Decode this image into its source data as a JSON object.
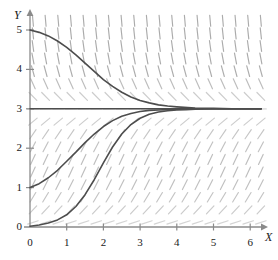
{
  "figure": {
    "kind": "direction-field-plot",
    "background": "#ffffff",
    "ink_color": "#1a1a1a",
    "field_color": "#8c8c8c",
    "curve_color": "#4d4d4d",
    "axis_color": "#8a8a8a"
  },
  "axes": {
    "x_name": "X",
    "y_name": "Y",
    "x_ticks": [
      "0",
      "1",
      "2",
      "3",
      "4",
      "5",
      "6"
    ],
    "y_ticks": [
      "0",
      "1",
      "2",
      "3",
      "4",
      "5"
    ],
    "x_origin_label": "0",
    "y_origin_label": "0"
  },
  "chart_data": {
    "type": "line",
    "title": "",
    "xlabel": "X",
    "ylabel": "Y",
    "xlim": [
      0,
      6.3
    ],
    "ylim": [
      0,
      5.3
    ],
    "grid": false,
    "legend": "none",
    "x_ticks": [
      0,
      1,
      2,
      3,
      4,
      5,
      6
    ],
    "y_ticks": [
      0,
      1,
      2,
      3,
      4,
      5
    ],
    "annotations": [
      "direction field of dy/dx = k*y*(3 - y)",
      "equilibrium solution y = 3",
      "equilibrium solution y = 0"
    ],
    "direction_field": {
      "description": "short line segments with slope proportional to y*(3-y); flat near y=0 and y=3, positive for 0<y<3, negative for y>3",
      "slope_rule": "dy/dx = 0.9 * y * (3 - y)",
      "x_start": 0.08,
      "x_step": 0.345,
      "y_start": 0.115,
      "y_step": 0.32,
      "segment_length_px": 11
    },
    "series": [
      {
        "name": "solution-from-y0-5",
        "initial_point": [
          0,
          5
        ],
        "kind": "decreasing-to-equilibrium",
        "asymptote": 3,
        "values": [
          [
            0.0,
            5.0
          ],
          [
            0.25,
            4.94
          ],
          [
            0.5,
            4.85
          ],
          [
            0.75,
            4.72
          ],
          [
            1.0,
            4.56
          ],
          [
            1.25,
            4.37
          ],
          [
            1.5,
            4.16
          ],
          [
            1.75,
            3.95
          ],
          [
            2.0,
            3.74
          ],
          [
            2.25,
            3.57
          ],
          [
            2.5,
            3.42
          ],
          [
            2.75,
            3.3
          ],
          [
            3.0,
            3.21
          ],
          [
            3.25,
            3.15
          ],
          [
            3.5,
            3.1
          ],
          [
            3.75,
            3.07
          ],
          [
            4.0,
            3.05
          ],
          [
            4.5,
            3.02
          ],
          [
            5.0,
            3.01
          ],
          [
            5.5,
            3.0
          ],
          [
            6.3,
            3.0
          ]
        ]
      },
      {
        "name": "equilibrium-y-3",
        "initial_point": [
          0,
          3
        ],
        "kind": "equilibrium",
        "asymptote": 3,
        "values": [
          [
            0.0,
            3.0
          ],
          [
            6.3,
            3.0
          ]
        ]
      },
      {
        "name": "solution-from-y0-1",
        "initial_point": [
          0,
          1
        ],
        "kind": "increasing-to-equilibrium",
        "asymptote": 3,
        "values": [
          [
            0.0,
            1.0
          ],
          [
            0.25,
            1.1
          ],
          [
            0.5,
            1.25
          ],
          [
            0.75,
            1.44
          ],
          [
            1.0,
            1.67
          ],
          [
            1.25,
            1.9
          ],
          [
            1.5,
            2.14
          ],
          [
            1.75,
            2.36
          ],
          [
            2.0,
            2.55
          ],
          [
            2.25,
            2.7
          ],
          [
            2.5,
            2.81
          ],
          [
            2.75,
            2.88
          ],
          [
            3.0,
            2.93
          ],
          [
            3.25,
            2.96
          ],
          [
            3.5,
            2.97
          ],
          [
            3.75,
            2.98
          ],
          [
            4.0,
            2.99
          ],
          [
            4.5,
            3.0
          ],
          [
            5.0,
            3.0
          ],
          [
            6.3,
            3.0
          ]
        ]
      },
      {
        "name": "solution-from-y0-0-05",
        "initial_point": [
          0,
          0.02
        ],
        "kind": "increasing-to-equilibrium",
        "asymptote": 3,
        "values": [
          [
            0.0,
            0.02
          ],
          [
            0.25,
            0.05
          ],
          [
            0.5,
            0.1
          ],
          [
            0.75,
            0.18
          ],
          [
            1.0,
            0.31
          ],
          [
            1.25,
            0.52
          ],
          [
            1.5,
            0.82
          ],
          [
            1.75,
            1.2
          ],
          [
            2.0,
            1.63
          ],
          [
            2.25,
            2.03
          ],
          [
            2.5,
            2.36
          ],
          [
            2.75,
            2.6
          ],
          [
            3.0,
            2.76
          ],
          [
            3.25,
            2.86
          ],
          [
            3.5,
            2.92
          ],
          [
            3.75,
            2.95
          ],
          [
            4.0,
            2.97
          ],
          [
            4.25,
            2.98
          ],
          [
            4.5,
            2.99
          ],
          [
            5.0,
            3.0
          ],
          [
            5.5,
            3.0
          ],
          [
            6.3,
            3.0
          ]
        ]
      }
    ]
  }
}
